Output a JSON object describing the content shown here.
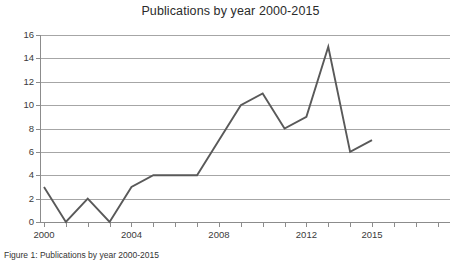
{
  "figure": {
    "caption": "Figure 1: Publications by year 2000-2015"
  },
  "chart_data": {
    "type": "line",
    "title": "Publications by year 2000-2015",
    "xlabel": "",
    "ylabel": "",
    "categories": [
      2000,
      2001,
      2002,
      2003,
      2004,
      2005,
      2006,
      2007,
      2008,
      2009,
      2010,
      2011,
      2012,
      2013,
      2014,
      2015
    ],
    "values": [
      3,
      0,
      2,
      0,
      3,
      4,
      4,
      4,
      7,
      10,
      11,
      8,
      9,
      15,
      6,
      7
    ],
    "x": [
      2000,
      2001,
      2002,
      2003,
      2004,
      2005,
      2006,
      2007,
      2008,
      2009,
      2010,
      2011,
      2012,
      2013,
      2014,
      2015
    ],
    "series": [
      {
        "name": "Publications",
        "values": [
          3,
          0,
          2,
          0,
          3,
          4,
          4,
          4,
          7,
          10,
          11,
          8,
          9,
          15,
          6,
          7
        ]
      }
    ],
    "ylim": [
      0,
      16
    ],
    "xlim": [
      2000,
      2015
    ],
    "y_ticks": [
      0,
      2,
      4,
      6,
      8,
      10,
      12,
      14,
      16
    ],
    "y_tick_labels": [
      "0",
      "2",
      "4",
      "6",
      "8",
      "10",
      "12",
      "14",
      "16"
    ],
    "x_tick_labels": [
      "2000",
      "2004",
      "2008",
      "2012",
      "2015"
    ],
    "x_tick_values": [
      2000,
      2004,
      2008,
      2012,
      2015
    ],
    "x_minor_ticks": [
      2000,
      2001,
      2002,
      2003,
      2004,
      2005,
      2006,
      2007,
      2008,
      2009,
      2010,
      2011,
      2012,
      2013,
      2014,
      2015,
      2016,
      2017,
      2018
    ],
    "grid": true,
    "grid_axis": "y",
    "legend": false,
    "legend_position": "none",
    "line_color": "#595959",
    "grid_color": "#a6a6a6",
    "axis_color": "#8c8c8c",
    "text_color": "#3a3a3a",
    "background": "#ffffff"
  }
}
